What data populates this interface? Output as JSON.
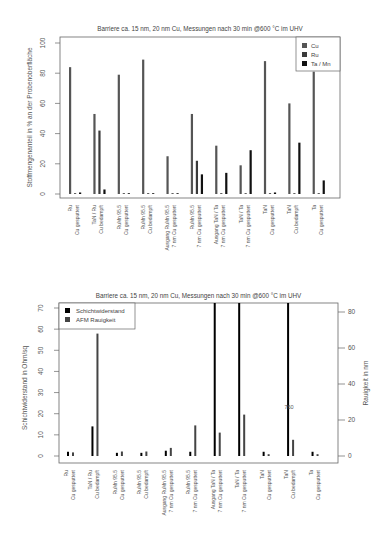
{
  "chart_data": [
    {
      "type": "bar",
      "title": "Barriere ca. 15 nm, 20 nm Cu, Messungen nach 30 min @600 °C im UHV",
      "xlabel": "",
      "ylabel": "Stoffmengenanteil in % an der Probenoberfläche",
      "ylim": [
        0,
        100
      ],
      "yticks": [
        0,
        20,
        40,
        60,
        80,
        100
      ],
      "grid": false,
      "legend_position": "top-right",
      "categories": [
        [
          "Ru",
          "Cu gesputtert"
        ],
        [
          "TaN / Ru",
          "Cu bedampft"
        ],
        [
          "RuMn 95.5",
          "Cu gesputtert"
        ],
        [
          "RuMn 95.5",
          "Cu bedampft"
        ],
        [
          "Ausgang RuMn 95.5",
          "7 nm Cu gesputtert"
        ],
        [
          "RuMn 95.5",
          "7 nm Cu gesputtert"
        ],
        [
          "Ausgang TaN / Ta",
          "7 nm Cu gesputtert"
        ],
        [
          "TaN / Ta",
          "7 nm Cu gesputtert"
        ],
        [
          "TaN",
          "Cu gesputtert"
        ],
        [
          "TaN",
          "Cu bedampft"
        ],
        [
          "Ta",
          "Cu gesputtert"
        ]
      ],
      "series": [
        {
          "name": "Cu",
          "color": "#555555",
          "values": [
            84,
            53,
            79,
            89,
            25,
            53,
            32,
            19,
            88,
            60,
            81
          ]
        },
        {
          "name": "Ru",
          "color": "#3a3a3a",
          "values": [
            0,
            42,
            0.5,
            0.5,
            0.5,
            22,
            0,
            0,
            0,
            0,
            0
          ]
        },
        {
          "name": "Ta / Mn",
          "color": "#111111",
          "values": [
            1,
            3,
            0.5,
            0.5,
            0.5,
            13,
            14,
            29,
            1,
            34,
            9
          ]
        }
      ]
    },
    {
      "type": "bar",
      "title": "Barriere ca. 15 nm, 20 nm Cu, Messungen nach 30 min @600 °C im UHV",
      "xlabel": "",
      "ylabel": "Schichtwiderstand in Ohm/sq",
      "ylabel_right": "Rauigkeit in nm",
      "ylim": [
        0,
        70
      ],
      "ylim_right": [
        0,
        80
      ],
      "yticks": [
        0,
        10,
        20,
        30,
        40,
        50,
        60,
        70
      ],
      "yticks_right": [
        0,
        20,
        40,
        60,
        80
      ],
      "grid": false,
      "legend_position": "top-left",
      "annotation": "760",
      "categories": [
        [
          "Ru",
          "Cu gesputtert"
        ],
        [
          "TaN / Ru",
          "Cu bedampft"
        ],
        [
          "RuMn 95.5",
          "Cu gesputtert"
        ],
        [
          "RuMn 95.5",
          "Cu bedampft"
        ],
        [
          "Ausgang RuMn 95.5",
          "7 nm Cu gesputtert"
        ],
        [
          "RuMn 95.5",
          "7 nm Cu gesputtert"
        ],
        [
          "Ausgang TaN / Ta",
          "7 nm Cu gesputtert"
        ],
        [
          "TaN / Ta",
          "7 nm Cu gesputtert"
        ],
        [
          "TaN",
          "Cu gesputtert"
        ],
        [
          "TaN",
          "Cu bedampft"
        ],
        [
          "Ta",
          "Cu gesputtert"
        ]
      ],
      "series": [
        {
          "name": "Schichtwiderstand",
          "axis": "left",
          "color": "#000000",
          "values": [
            2,
            14,
            1.5,
            1.5,
            2.5,
            2,
            760,
            760,
            2,
            760,
            2
          ]
        },
        {
          "name": "AFM Rauigkeit",
          "axis": "right",
          "color": "#444444",
          "values": [
            2,
            68,
            2.5,
            2.5,
            4.5,
            17,
            13,
            23,
            1,
            9,
            1
          ]
        }
      ]
    }
  ]
}
